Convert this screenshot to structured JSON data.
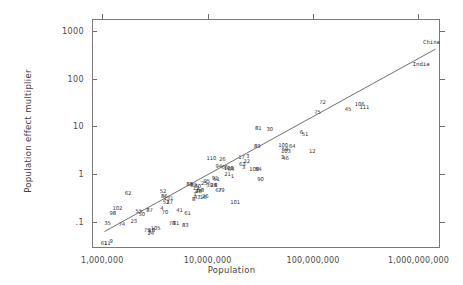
{
  "chart_data": {
    "type": "scatter",
    "title": "",
    "xlabel": "Population",
    "ylabel": "Population effect multiplier",
    "xscale": "log",
    "yscale": "log",
    "xlim": [
      800000,
      1600000000
    ],
    "ylim": [
      0.028,
      1800
    ],
    "grid": false,
    "legend": null,
    "xtick_labels": [
      "1,000,000",
      "10,000,000",
      "100,000,000",
      "1,000,000,000"
    ],
    "xtick_values": [
      1000000,
      10000000,
      100000000,
      1000000000
    ],
    "ytick_labels": [
      "1000",
      "100",
      "10",
      "1",
      ".1"
    ],
    "ytick_values": [
      1000,
      100,
      10,
      1,
      0.1
    ],
    "trendline": {
      "x_start": 1050000,
      "y_start": 0.062,
      "x_end": 1450000000,
      "y_end": 420
    },
    "annotations": [
      {
        "text": "China",
        "x": 1330000000,
        "y": 560
      },
      {
        "text": "India",
        "x": 1060000000,
        "y": 195
      }
    ],
    "points": [
      {
        "label": "61",
        "x": 1020000,
        "y": 0.036
      },
      {
        "label": "11",
        "x": 1090000,
        "y": 0.036
      },
      {
        "label": "9",
        "x": 1190000,
        "y": 0.04
      },
      {
        "label": "35",
        "x": 1100000,
        "y": 0.096
      },
      {
        "label": "98",
        "x": 1230000,
        "y": 0.155
      },
      {
        "label": "102",
        "x": 1360000,
        "y": 0.195
      },
      {
        "label": "62",
        "x": 1720000,
        "y": 0.4
      },
      {
        "label": "74",
        "x": 1500000,
        "y": 0.088
      },
      {
        "label": "23",
        "x": 1950000,
        "y": 0.105
      },
      {
        "label": "55",
        "x": 2180000,
        "y": 0.165
      },
      {
        "label": "50",
        "x": 2320000,
        "y": 0.145
      },
      {
        "label": "87",
        "x": 2750000,
        "y": 0.172
      },
      {
        "label": "52",
        "x": 3700000,
        "y": 0.43
      },
      {
        "label": "86",
        "x": 3800000,
        "y": 0.34
      },
      {
        "label": "131",
        "x": 4150000,
        "y": 0.315
      },
      {
        "label": "53",
        "x": 3950000,
        "y": 0.265
      },
      {
        "label": "27",
        "x": 4250000,
        "y": 0.262
      },
      {
        "label": "4",
        "x": 3600000,
        "y": 0.195
      },
      {
        "label": "70",
        "x": 3850000,
        "y": 0.163
      },
      {
        "label": "75",
        "x": 2600000,
        "y": 0.068
      },
      {
        "label": "5",
        "x": 2750000,
        "y": 0.063
      },
      {
        "label": "18",
        "x": 2880000,
        "y": 0.066
      },
      {
        "label": "24",
        "x": 2820000,
        "y": 0.058
      },
      {
        "label": "105",
        "x": 3150000,
        "y": 0.072
      },
      {
        "label": "78",
        "x": 4500000,
        "y": 0.092
      },
      {
        "label": "31",
        "x": 4900000,
        "y": 0.093
      },
      {
        "label": "83",
        "x": 6000000,
        "y": 0.087
      },
      {
        "label": "41",
        "x": 5300000,
        "y": 0.175
      },
      {
        "label": "61",
        "x": 6300000,
        "y": 0.152
      },
      {
        "label": "88",
        "x": 6600000,
        "y": 0.62
      },
      {
        "label": "89",
        "x": 7200000,
        "y": 0.6
      },
      {
        "label": "12",
        "x": 7600000,
        "y": 0.5
      },
      {
        "label": "30",
        "x": 7900000,
        "y": 0.56
      },
      {
        "label": "58",
        "x": 8400000,
        "y": 0.47
      },
      {
        "label": "2",
        "x": 7700000,
        "y": 0.44
      },
      {
        "label": "48",
        "x": 8000000,
        "y": 0.43
      },
      {
        "label": "1",
        "x": 7400000,
        "y": 0.38
      },
      {
        "label": "43",
        "x": 7800000,
        "y": 0.33
      },
      {
        "label": "8",
        "x": 7200000,
        "y": 0.3
      },
      {
        "label": "16",
        "x": 8900000,
        "y": 0.325
      },
      {
        "label": "26",
        "x": 9300000,
        "y": 0.34
      },
      {
        "label": "95",
        "x": 9600000,
        "y": 0.7
      },
      {
        "label": "25",
        "x": 9100000,
        "y": 0.66
      },
      {
        "label": "39",
        "x": 10200000,
        "y": 0.6
      },
      {
        "label": "28",
        "x": 11200000,
        "y": 0.6
      },
      {
        "label": "6",
        "x": 11700000,
        "y": 0.6
      },
      {
        "label": "67",
        "x": 12400000,
        "y": 0.46
      },
      {
        "label": "79",
        "x": 13200000,
        "y": 0.46
      },
      {
        "label": "91",
        "x": 11500000,
        "y": 0.83
      },
      {
        "label": "51",
        "x": 11900000,
        "y": 0.78
      },
      {
        "label": "110",
        "x": 10600000,
        "y": 2.2
      },
      {
        "label": "26",
        "x": 13500000,
        "y": 2.1
      },
      {
        "label": "94",
        "x": 12500000,
        "y": 1.45
      },
      {
        "label": "66",
        "x": 14200000,
        "y": 1.42
      },
      {
        "label": "108",
        "x": 15500000,
        "y": 1.35
      },
      {
        "label": "64",
        "x": 16300000,
        "y": 1.3
      },
      {
        "label": "21",
        "x": 15100000,
        "y": 1.02
      },
      {
        "label": "1",
        "x": 16800000,
        "y": 0.92
      },
      {
        "label": "101",
        "x": 17800000,
        "y": 0.265
      },
      {
        "label": "17",
        "x": 20500000,
        "y": 2.25
      },
      {
        "label": "3",
        "x": 23500000,
        "y": 2.45
      },
      {
        "label": "22",
        "x": 23000000,
        "y": 1.85
      },
      {
        "label": "63",
        "x": 20800000,
        "y": 1.62
      },
      {
        "label": "3",
        "x": 21500000,
        "y": 1.42
      },
      {
        "label": "108",
        "x": 27000000,
        "y": 1.3
      },
      {
        "label": "54",
        "x": 29500000,
        "y": 1.28
      },
      {
        "label": "90",
        "x": 31000000,
        "y": 0.8
      },
      {
        "label": "89",
        "x": 29000000,
        "y": 3.9
      },
      {
        "label": "81",
        "x": 29500000,
        "y": 9.2
      },
      {
        "label": "30",
        "x": 38000000,
        "y": 8.8
      },
      {
        "label": "100",
        "x": 51000000,
        "y": 4.0
      },
      {
        "label": "103",
        "x": 54000000,
        "y": 3.1
      },
      {
        "label": "59",
        "x": 53000000,
        "y": 3.3
      },
      {
        "label": "3",
        "x": 50000000,
        "y": 2.3
      },
      {
        "label": "46",
        "x": 53500000,
        "y": 2.2
      },
      {
        "label": "64",
        "x": 62000000,
        "y": 3.8
      },
      {
        "label": "51",
        "x": 82000000,
        "y": 7.0
      },
      {
        "label": "6",
        "x": 76000000,
        "y": 7.8
      },
      {
        "label": "12",
        "x": 96000000,
        "y": 3.0
      },
      {
        "label": "75",
        "x": 108000000,
        "y": 20.0
      },
      {
        "label": "72",
        "x": 120000000,
        "y": 33.0
      },
      {
        "label": "45",
        "x": 210000000,
        "y": 23.0
      },
      {
        "label": "106",
        "x": 270000000,
        "y": 29.0
      },
      {
        "label": "111",
        "x": 300000000,
        "y": 25.0
      }
    ]
  },
  "axes": {
    "y_title": "Population effect multiplier",
    "x_title": "Population"
  }
}
